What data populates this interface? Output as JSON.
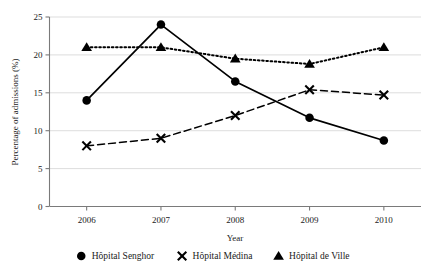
{
  "chart_data": {
    "type": "line",
    "title": "",
    "xlabel": "Year",
    "ylabel": "Percentage of admissions (%)",
    "categories": [
      "2006",
      "2007",
      "2008",
      "2009",
      "2010"
    ],
    "x": [
      2006,
      2007,
      2008,
      2009,
      2010
    ],
    "ylim": [
      0,
      25
    ],
    "yticks": [
      0,
      5,
      10,
      15,
      20,
      25
    ],
    "ytick_labels": [
      "0",
      "5",
      "10",
      "15",
      "20",
      "25"
    ],
    "grid": "horizontal",
    "legend_position": "bottom",
    "series": [
      {
        "name": "Hôpital Senghor",
        "marker": "circle",
        "linestyle": "solid",
        "color": "#000000",
        "values": [
          14.0,
          24.0,
          16.5,
          11.7,
          8.7
        ]
      },
      {
        "name": "Hôpital Médina",
        "marker": "x",
        "linestyle": "dashed",
        "color": "#000000",
        "values": [
          8.0,
          9.0,
          12.0,
          15.4,
          14.7
        ]
      },
      {
        "name": "Hôpital de Ville",
        "marker": "triangle",
        "linestyle": "dotted",
        "color": "#000000",
        "values": [
          21.0,
          21.0,
          19.5,
          18.8,
          21.0
        ]
      }
    ]
  },
  "axes": {
    "y_title": "Percentage of admissions (%)",
    "x_title": "Year",
    "y_ticks": [
      "0",
      "5",
      "10",
      "15",
      "20",
      "25"
    ],
    "x_ticks": [
      "2006",
      "2007",
      "2008",
      "2009",
      "2010"
    ]
  },
  "legend": {
    "items": [
      {
        "label": "Hôpital Senghor",
        "marker": "circle"
      },
      {
        "label": "Hôpital Médina",
        "marker": "x"
      },
      {
        "label": "Hôpital de Ville",
        "marker": "triangle"
      }
    ]
  },
  "colors": {
    "ink": "#000000",
    "grid": "#cfcfcf",
    "axis": "#7a7a7a",
    "background": "#ffffff"
  }
}
